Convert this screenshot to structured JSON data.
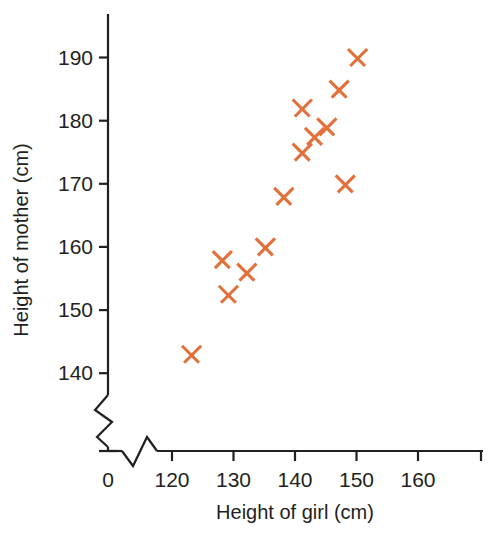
{
  "chart_data": {
    "type": "scatter",
    "title": "",
    "xlabel": "Height of girl (cm)",
    "ylabel": "Height of mother (cm)",
    "xlim": [
      118,
      166
    ],
    "ylim": [
      138,
      193
    ],
    "grid": false,
    "legend": null,
    "x_ticks": [
      "0",
      "120",
      "130",
      "140",
      "150",
      "160"
    ],
    "y_ticks": [
      "140",
      "150",
      "160",
      "170",
      "180",
      "190"
    ],
    "x_axis_break": true,
    "y_axis_break": true,
    "marker": "x",
    "marker_color": "#E2703A",
    "series": [
      {
        "name": "girl vs mother height",
        "points": [
          {
            "x": 123,
            "y": 143
          },
          {
            "x": 128,
            "y": 158
          },
          {
            "x": 129,
            "y": 152.5
          },
          {
            "x": 132,
            "y": 156
          },
          {
            "x": 135,
            "y": 160
          },
          {
            "x": 138,
            "y": 168
          },
          {
            "x": 141,
            "y": 182
          },
          {
            "x": 141,
            "y": 175
          },
          {
            "x": 143,
            "y": 177.5
          },
          {
            "x": 145,
            "y": 179
          },
          {
            "x": 147,
            "y": 185
          },
          {
            "x": 148,
            "y": 170
          },
          {
            "x": 150,
            "y": 190
          }
        ]
      }
    ]
  },
  "axes": {
    "x_title": "Height of girl (cm)",
    "y_title": "Height of mother (cm)",
    "x_tick_labels": [
      "0",
      "120",
      "130",
      "140",
      "150",
      "160"
    ],
    "y_tick_labels": [
      "140",
      "150",
      "160",
      "170",
      "180",
      "190"
    ]
  },
  "colors": {
    "marker": "#E2703A",
    "axis": "#231f20",
    "background": "#ffffff"
  }
}
